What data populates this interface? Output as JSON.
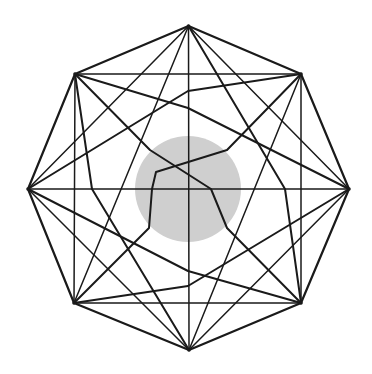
{
  "diagram": {
    "title": "",
    "colors": {
      "stroke": "#1a1a1a",
      "obstacle": "#cfcfcf",
      "background": "#ffffff"
    },
    "vertices": [
      "top",
      "top-right",
      "right",
      "bottom-right",
      "bottom",
      "bottom-left",
      "left",
      "top-left"
    ],
    "obstacle": {
      "shape": "circle",
      "position": "center"
    },
    "edges": [
      {
        "from": "top",
        "to": "top-right",
        "kind": "side"
      },
      {
        "from": "top-right",
        "to": "right",
        "kind": "side"
      },
      {
        "from": "right",
        "to": "bottom-right",
        "kind": "side"
      },
      {
        "from": "bottom-right",
        "to": "bottom",
        "kind": "side"
      },
      {
        "from": "bottom",
        "to": "bottom-left",
        "kind": "side"
      },
      {
        "from": "bottom-left",
        "to": "left",
        "kind": "side"
      },
      {
        "from": "left",
        "to": "top-left",
        "kind": "side"
      },
      {
        "from": "top-left",
        "to": "top",
        "kind": "side"
      },
      {
        "from": "top",
        "to": "bottom",
        "kind": "straight"
      },
      {
        "from": "left",
        "to": "right",
        "kind": "straight"
      },
      {
        "from": "top-left",
        "to": "top-right",
        "kind": "straight"
      },
      {
        "from": "bottom-left",
        "to": "bottom-right",
        "kind": "straight"
      },
      {
        "from": "top-left",
        "to": "bottom-left",
        "kind": "straight"
      },
      {
        "from": "top-right",
        "to": "bottom-right",
        "kind": "straight"
      },
      {
        "from": "top",
        "to": "right",
        "kind": "straight"
      },
      {
        "from": "top",
        "to": "left",
        "kind": "straight"
      },
      {
        "from": "bottom",
        "to": "right",
        "kind": "straight"
      },
      {
        "from": "bottom",
        "to": "left",
        "kind": "straight"
      },
      {
        "from": "top",
        "to": "bottom-left",
        "kind": "straight"
      },
      {
        "from": "top",
        "to": "bottom-right",
        "kind": "bent"
      },
      {
        "from": "bottom",
        "to": "top-right",
        "kind": "straight"
      },
      {
        "from": "bottom",
        "to": "top-left",
        "kind": "bent"
      },
      {
        "from": "left",
        "to": "top-right",
        "kind": "bent"
      },
      {
        "from": "left",
        "to": "bottom-right",
        "kind": "bent"
      },
      {
        "from": "right",
        "to": "top-left",
        "kind": "bent"
      },
      {
        "from": "right",
        "to": "bottom-left",
        "kind": "bent"
      },
      {
        "from": "top-left",
        "to": "bottom-right",
        "kind": "bent"
      },
      {
        "from": "top-right",
        "to": "bottom-left",
        "kind": "bent"
      }
    ]
  }
}
